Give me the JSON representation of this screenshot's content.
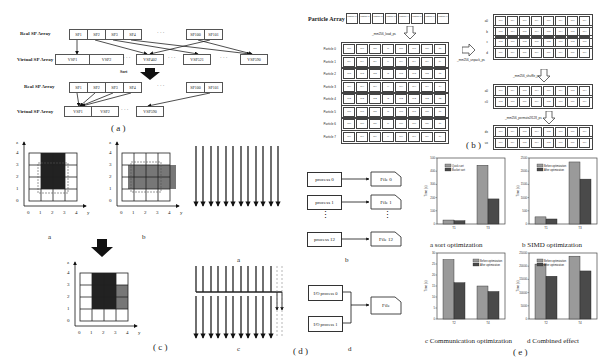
{
  "panel_a": {
    "caption": "( a )",
    "top": {
      "real_label": "Real SP Array",
      "virtual_label": "Virtual SP Array",
      "real_cells": [
        "SP1",
        "SP2",
        "SP3",
        "SP4",
        "SP100",
        "SP101"
      ],
      "virtual_cells": [
        "VSP1",
        "VSP2",
        "VSP402",
        "VSP521",
        "VSP590"
      ],
      "ellipsis": "· · ·"
    },
    "sort_label": "Sort",
    "bottom": {
      "real_label": "Real SP Array",
      "virtual_label": "Virtual SP Array",
      "real_cells": [
        "SP1",
        "SP2",
        "SP3",
        "SP4",
        "SP100",
        "SP101"
      ],
      "virtual_cells": [
        "VSP1",
        "VSP2",
        "VSP590"
      ],
      "ellipsis": "· · ·"
    }
  },
  "panel_b": {
    "caption": "( b )",
    "particle_array_label": "Particle Array",
    "particle_cells": [
      "Particle 0",
      "Particle 1",
      "Particle 2",
      "Particle 3",
      "Particle 4",
      "Particle 5",
      "Particle 6",
      "Particle 7"
    ],
    "load_label": "_mm256_load_ps",
    "rows": [
      {
        "name": "Particle 0",
        "cells": [
          "dx0",
          "dy0",
          "dz0",
          "i0",
          "ux0",
          "uy0",
          "uz0",
          "q0"
        ]
      },
      {
        "name": "Particle 1",
        "cells": [
          "dx1",
          "dy1",
          "dz1",
          "i1",
          "ux1",
          "uy1",
          "uz1",
          "q1"
        ]
      },
      {
        "name": "Particle 2",
        "cells": [
          "dx2",
          "dy2",
          "dz2",
          "i2",
          "ux2",
          "uy2",
          "uz2",
          "q2"
        ]
      },
      {
        "name": "Particle 3",
        "cells": [
          "dx3",
          "dy3",
          "dz3",
          "i3",
          "ux3",
          "uy3",
          "uz3",
          "q3"
        ]
      },
      {
        "name": "Particle 4",
        "cells": [
          "dx4",
          "dy4",
          "dz4",
          "i4",
          "ux4",
          "uy4",
          "uz4",
          "q4"
        ]
      },
      {
        "name": "Particle 5",
        "cells": [
          "dx5",
          "dy5",
          "dz5",
          "i5",
          "ux5",
          "uy5",
          "uz5",
          "q5"
        ]
      },
      {
        "name": "Particle 6",
        "cells": [
          "dx6",
          "dy6",
          "dz6",
          "i6",
          "ux6",
          "uy6",
          "uz6",
          "q6"
        ]
      },
      {
        "name": "Particle 7",
        "cells": [
          "dx7",
          "dy7",
          "dz7",
          "i7",
          "ux7",
          "uy7",
          "uz7",
          "q7"
        ]
      }
    ],
    "unpack_label": "_mm256_unpack_ps",
    "right_rows_1": [
      {
        "name": "a0",
        "cells": [
          "dx0",
          "dx1",
          "dy0",
          "dy1",
          "ux0",
          "ux1",
          "uy0",
          "uy1"
        ]
      },
      {
        "name": "b",
        "cells": [
          "dx2",
          "dx3",
          "dy2",
          "dy3",
          "ux2",
          "ux3",
          "uy2",
          "uy3"
        ]
      },
      {
        "name": "c",
        "cells": [
          "dx4",
          "dx5",
          "dy4",
          "dy5",
          "ux4",
          "ux5",
          "uy4",
          "uy5"
        ]
      },
      {
        "name": "d",
        "cells": [
          "dx6",
          "dx7",
          "dy6",
          "dy7",
          "ux6",
          "ux7",
          "uy6",
          "uy7"
        ]
      }
    ],
    "shuffle_label": "_mm256_shuffle_ps",
    "right_rows_2": [
      {
        "name": "a0",
        "cells": [
          "dx0",
          "dx1",
          "dx2",
          "dx3",
          "ux0",
          "ux1",
          "ux2",
          "ux3"
        ]
      },
      {
        "name": "c0",
        "cells": [
          "dx4",
          "dx5",
          "dx6",
          "dx7",
          "ux4",
          "ux5",
          "ux6",
          "ux7"
        ]
      }
    ],
    "permute_label": "_mm256_permute2f128_ps",
    "right_rows_3": [
      {
        "name": "dx",
        "cells": [
          "dx0",
          "dx1",
          "dx2",
          "dx3",
          "dx4",
          "dx5",
          "dx6",
          "dx7"
        ]
      },
      {
        "name": "ux",
        "cells": [
          "ux0",
          "ux1",
          "ux2",
          "ux3",
          "ux4",
          "ux5",
          "ux6",
          "ux7"
        ]
      }
    ]
  },
  "panel_c": {
    "caption": "( c )",
    "sub_a": "a",
    "sub_b": "b",
    "axis_z": "z",
    "axis_y": "y",
    "ticks": [
      "0",
      "1",
      "2",
      "3",
      "4"
    ]
  },
  "panel_d": {
    "caption": "( d )",
    "sub_a": "a",
    "sub_b": "b",
    "sub_c": "c",
    "sub_d": "d",
    "processes": [
      "process 0",
      "process 1",
      "process 12"
    ],
    "files": [
      "File 0",
      "File 1",
      "File 12"
    ],
    "io_processes": [
      "I/O process 0",
      "I/O process 1"
    ],
    "io_file": "File",
    "vdots": "⋮"
  },
  "panel_e": {
    "caption": "( e )",
    "colors": {
      "before": "#9a9a9a",
      "after": "#4a4a4a"
    }
  },
  "chart_data": [
    {
      "type": "bar",
      "title": "a  sort optimization",
      "xlabel": "",
      "ylabel": "Time (s)",
      "categories": [
        "T1",
        "T3"
      ],
      "series": [
        {
          "name": "Quick sort",
          "values": [
            30,
            445
          ]
        },
        {
          "name": "Bucket sort",
          "values": [
            25,
            190
          ]
        }
      ],
      "ylim": [
        0,
        500
      ],
      "yticks": [
        "0",
        "100",
        "200",
        "300",
        "400",
        "500"
      ],
      "legend_position": "upper-left",
      "grid": false
    },
    {
      "type": "bar",
      "title": "b  SIMD optimization",
      "xlabel": "",
      "ylabel": "Time (s)",
      "categories": [
        "T1",
        "T3"
      ],
      "series": [
        {
          "name": "Before optimization",
          "values": [
            270,
            2350
          ]
        },
        {
          "name": "After optimization",
          "values": [
            190,
            1700
          ]
        }
      ],
      "ylim": [
        0,
        2500
      ],
      "yticks": [
        "0",
        "500",
        "1000",
        "1500",
        "2000",
        "2500"
      ],
      "legend_position": "upper-left",
      "grid": false
    },
    {
      "type": "bar",
      "title": "c  Communication optimization",
      "xlabel": "",
      "ylabel": "Time (s)",
      "categories": [
        "T2",
        "T4"
      ],
      "series": [
        {
          "name": "Before optimization",
          "values": [
            27,
            15
          ]
        },
        {
          "name": "After optimization",
          "values": [
            16.5,
            12.5
          ]
        }
      ],
      "ylim": [
        0,
        30
      ],
      "yticks": [
        "0",
        "5",
        "10",
        "15",
        "20",
        "25",
        "30"
      ],
      "legend_position": "upper-right",
      "grid": false
    },
    {
      "type": "bar",
      "title": "d  Combined effect",
      "xlabel": "",
      "ylabel": "Time (s)",
      "categories": [
        "T2",
        "T4"
      ],
      "series": [
        {
          "name": "Before optimization",
          "values": [
            20800,
            23800
          ]
        },
        {
          "name": "After optimization",
          "values": [
            16200,
            18200
          ]
        }
      ],
      "ylim": [
        0,
        25000
      ],
      "yticks": [
        "0",
        "5000",
        "10000",
        "15000",
        "20000",
        "25000"
      ],
      "legend_position": "upper-left",
      "grid": false
    }
  ]
}
